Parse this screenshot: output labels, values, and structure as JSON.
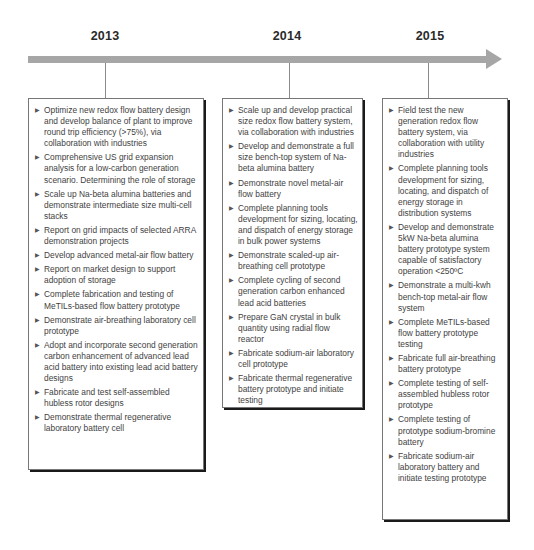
{
  "timeline": {
    "years": [
      "2013",
      "2014",
      "2015"
    ],
    "accent_color": "#a6a6a6"
  },
  "boxes": [
    {
      "year": "2013",
      "items": [
        "Optimize new redox flow battery design and develop balance of plant to improve round trip efficiency (>75%), via collaboration with industries",
        "Comprehensive US grid expansion analysis for a low-carbon generation scenario. Determining the role of storage",
        "Scale up Na-beta alumina batteries and demonstrate intermediate size multi-cell stacks",
        "Report on grid impacts of selected ARRA demonstration projects",
        "Develop advanced metal-air  flow battery",
        "Report on market design to support adoption of storage",
        "Complete fabrication and testing of MeTILs-based flow battery prototype",
        "Demonstrate air-breathing laboratory cell prototype",
        "Adopt and incorporate second generation carbon enhancement of advanced lead acid battery into existing lead acid battery designs",
        "Fabricate and test self-assembled hubless rotor designs",
        "Demonstrate thermal regenerative laboratory battery cell"
      ]
    },
    {
      "year": "2014",
      "items": [
        "Scale up and develop practical size  redox flow battery system, via collaboration with industries",
        "Develop and demonstrate  a full size bench-top system of Na-beta alumina battery",
        "Demonstrate novel metal-air flow battery",
        "Complete planning tools development for sizing, locating, and dispatch of energy storage in bulk power systems",
        "Demonstrate scaled-up air-breathing cell prototype",
        "Complete cycling of second generation carbon enhanced lead acid batteries",
        "Prepare GaN crystal in bulk quantity using radial flow reactor",
        "Fabricate sodium-air laboratory cell prototype",
        "Fabricate thermal regenerative battery prototype and initiate testing"
      ]
    },
    {
      "year": "2015",
      "items": [
        "Field test the new generation  redox flow battery system,  via collaboration with utility industries",
        "Complete planning tools development for sizing, locating, and dispatch of energy storage in distribution systems",
        "Develop and demonstrate 5kW  Na-beta alumina battery prototype system capable of satisfactory operation <250ºC",
        "Demonstrate a multi-kwh bench-top metal-air flow system",
        "Complete MeTILs-based flow battery prototype testing",
        "Fabricate full air-breathing battery prototype",
        "Complete testing of self-assembled hubless rotor prototype",
        "Complete testing of prototype sodium-bromine battery",
        "Fabricate sodium-air laboratory battery and initiate testing prototype"
      ]
    }
  ]
}
